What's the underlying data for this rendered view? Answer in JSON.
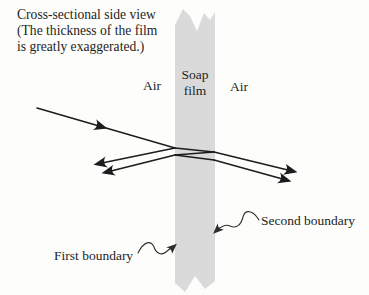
{
  "caption": {
    "lines": [
      "Cross-sectional side view",
      "(The thickness of the film",
      "is greatly exaggerated.)"
    ]
  },
  "labels": {
    "air_left": "Air",
    "soap_film": [
      "Soap",
      "film"
    ],
    "air_right": "Air",
    "first_boundary": "First boundary",
    "second_boundary": "Second boundary"
  },
  "colors": {
    "background": "#fdfdfb",
    "film": "#dadada",
    "ray": "#1c1c1c",
    "leader": "#2e2e2e",
    "text": "#1e1e1e"
  }
}
